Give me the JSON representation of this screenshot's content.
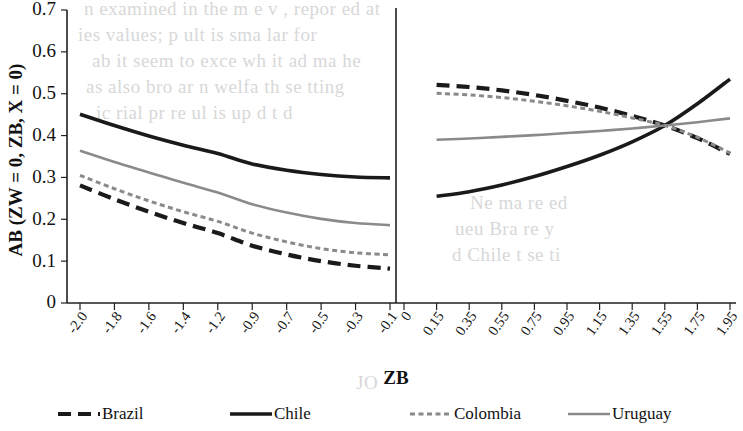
{
  "chart_data": {
    "type": "line",
    "title": "",
    "xlabel": "ZB",
    "ylabel": "AB (ZW = 0, ZB, X = 0)",
    "ylim": [
      0,
      0.7
    ],
    "ytick_labels": [
      "0",
      "0.1",
      "0.2",
      "0.3",
      "0.4",
      "0.5",
      "0.6",
      "0.7"
    ],
    "ytick_values": [
      0,
      0.1,
      0.2,
      0.3,
      0.4,
      0.5,
      0.6,
      0.7
    ],
    "grid": false,
    "legend_position": "bottom",
    "panels": [
      {
        "name": "left-panel",
        "xtick_labels": [
          "-2.0",
          "-1.8",
          "-1.6",
          "-1.4",
          "-1.2",
          "-0.9",
          "-0.7",
          "-0.5",
          "-0.3",
          "-0.1"
        ],
        "x": [
          -2.0,
          -1.8,
          -1.6,
          -1.4,
          -1.2,
          -0.9,
          -0.7,
          -0.5,
          -0.3,
          -0.1
        ],
        "series": [
          {
            "name": "Brazil",
            "values": [
              0.281,
              0.248,
              0.218,
              0.191,
              0.167,
              0.137,
              0.116,
              0.1,
              0.089,
              0.082
            ]
          },
          {
            "name": "Chile",
            "values": [
              0.451,
              0.424,
              0.399,
              0.377,
              0.357,
              0.332,
              0.317,
              0.307,
              0.301,
              0.299
            ]
          },
          {
            "name": "Colombia",
            "values": [
              0.305,
              0.273,
              0.244,
              0.218,
              0.195,
              0.167,
              0.146,
              0.13,
              0.12,
              0.115
            ]
          },
          {
            "name": "Uruguay",
            "values": [
              0.364,
              0.337,
              0.312,
              0.287,
              0.264,
              0.236,
              0.216,
              0.201,
              0.191,
              0.186
            ]
          }
        ]
      },
      {
        "name": "right-panel",
        "xtick_labels": [
          "0",
          "0.15",
          "0.35",
          "0.55",
          "0.75",
          "0.95",
          "1.15",
          "1.35",
          "1.55",
          "1.75",
          "1.95"
        ],
        "x": [
          0.15,
          0.35,
          0.55,
          0.75,
          0.95,
          1.15,
          1.35,
          1.55,
          1.75,
          1.95
        ],
        "series": [
          {
            "name": "Brazil",
            "values": [
              0.521,
              0.516,
              0.508,
              0.497,
              0.483,
              0.467,
              0.447,
              0.424,
              0.394,
              0.356
            ]
          },
          {
            "name": "Chile",
            "values": [
              0.255,
              0.266,
              0.282,
              0.302,
              0.326,
              0.353,
              0.385,
              0.424,
              0.476,
              0.535
            ]
          },
          {
            "name": "Colombia",
            "values": [
              0.501,
              0.497,
              0.491,
              0.482,
              0.471,
              0.458,
              0.442,
              0.424,
              0.396,
              0.358
            ]
          },
          {
            "name": "Uruguay",
            "values": [
              0.39,
              0.393,
              0.397,
              0.401,
              0.406,
              0.411,
              0.417,
              0.424,
              0.432,
              0.441
            ]
          }
        ]
      }
    ],
    "legend": [
      {
        "label": "Brazil",
        "color": "#1a1a1a",
        "style": "dashed"
      },
      {
        "label": "Chile",
        "color": "#1a1a1a",
        "style": "solid"
      },
      {
        "label": "Colombia",
        "color": "#8a8a8a",
        "style": "dotted"
      },
      {
        "label": "Uruguay",
        "color": "#8a8a8a",
        "style": "solid"
      }
    ]
  },
  "background_text": {
    "lines": [
      "n examined in the m  e  v  , repor ed  at",
      "ies values; p    ult is sma     lar  for",
      "ab it seem  to  exce   wh  it  ad ma   he",
      "as also bro   ar   n  welfa    th   se tting",
      "ic   rial pr         re  ul  is  up  d  t  d"
    ],
    "lines_lower": [
      "   Ne  ma  re   ed",
      "ueu   Bra   re    y",
      "d Chile  t  se  ti"
    ],
    "mark": "JO"
  }
}
